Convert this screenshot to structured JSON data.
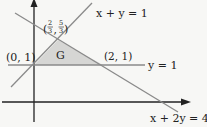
{
  "diagram": {
    "title": "",
    "region": {
      "label": "G",
      "fill": "#d6d6d4"
    },
    "axes": {
      "color": "#222222"
    },
    "lines": [
      {
        "id": "line-rising",
        "label": "x + y = 1",
        "color": "#8a8a8a"
      },
      {
        "id": "line-horizontal",
        "label": "y = 1",
        "color": "#8a8a8a"
      },
      {
        "id": "line-falling",
        "label": "x + 2y = 4",
        "color": "#8a8a8a"
      }
    ],
    "points": [
      {
        "label": "(0, 1)"
      },
      {
        "label": "(2, 1)"
      },
      {
        "label_num_x": "2",
        "label_den_x": "3",
        "label_num_y": "5",
        "label_den_y": "3"
      }
    ]
  }
}
